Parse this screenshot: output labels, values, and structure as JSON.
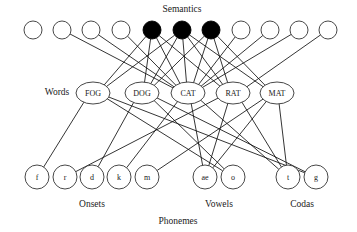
{
  "diagram": {
    "title_label": "Semantics",
    "words_label": "Words",
    "phonemes_label": "Phonemes",
    "onsets_label": "Onsets",
    "vowels_label": "Vowels",
    "codas_label": "Codas",
    "colors": {
      "active_node": "#000000",
      "inactive_node": "#ffffff",
      "node_stroke": "#333333",
      "edge": "#111111",
      "background": "#ffffff",
      "text": "#1a1a1a"
    }
  },
  "semantics": {
    "label": "Semantics",
    "label_x": 182,
    "label_y": 10,
    "y": 30,
    "radius": 9,
    "nodes": [
      {
        "id": "sem1",
        "x": 33,
        "active": false
      },
      {
        "id": "sem2",
        "x": 62,
        "active": false
      },
      {
        "id": "sem3",
        "x": 91,
        "active": false
      },
      {
        "id": "sem4",
        "x": 121,
        "active": false
      },
      {
        "id": "sem5",
        "x": 152,
        "active": true
      },
      {
        "id": "sem6",
        "x": 182,
        "active": true
      },
      {
        "id": "sem7",
        "x": 211,
        "active": true
      },
      {
        "id": "sem8",
        "x": 241,
        "active": false
      },
      {
        "id": "sem9",
        "x": 270,
        "active": false
      },
      {
        "id": "sem10",
        "x": 299,
        "active": false
      },
      {
        "id": "sem11",
        "x": 328,
        "active": false
      }
    ]
  },
  "words": {
    "label": "Words",
    "label_x": 57,
    "label_y": 93,
    "y": 93,
    "rx": 17,
    "ry": 11,
    "nodes": [
      {
        "id": "FOG",
        "label": "FOG",
        "x": 93,
        "onset": "f",
        "vowel": "o",
        "coda": "g"
      },
      {
        "id": "DOG",
        "label": "DOG",
        "x": 142,
        "onset": "d",
        "vowel": "o",
        "coda": "g"
      },
      {
        "id": "CAT",
        "label": "CAT",
        "x": 188,
        "onset": "k",
        "vowel": "ae",
        "coda": "t"
      },
      {
        "id": "RAT",
        "label": "RAT",
        "x": 233,
        "onset": "r",
        "vowel": "ae",
        "coda": "t"
      },
      {
        "id": "MAT",
        "label": "MAT",
        "x": 277,
        "onset": "m",
        "vowel": "ae",
        "coda": "t"
      }
    ]
  },
  "phonemes": {
    "label": "Phonemes",
    "label_x": 178,
    "label_y": 222,
    "y": 177,
    "radius": 12,
    "groups": [
      {
        "name": "Onsets",
        "label": "Onsets",
        "label_x": 92,
        "label_y": 205,
        "nodes": [
          {
            "id": "f",
            "label": "f",
            "x": 37
          },
          {
            "id": "r",
            "label": "r",
            "x": 65
          },
          {
            "id": "d",
            "label": "d",
            "x": 92
          },
          {
            "id": "k",
            "label": "k",
            "x": 119
          },
          {
            "id": "m",
            "label": "m",
            "x": 147
          }
        ]
      },
      {
        "name": "Vowels",
        "label": "Vowels",
        "label_x": 219,
        "label_y": 205,
        "nodes": [
          {
            "id": "ae",
            "label": "ae",
            "x": 205
          },
          {
            "id": "o",
            "label": "o",
            "x": 233
          }
        ]
      },
      {
        "name": "Codas",
        "label": "Codas",
        "label_x": 302,
        "label_y": 205,
        "nodes": [
          {
            "id": "t",
            "label": "t",
            "x": 288
          },
          {
            "id": "g",
            "label": "g",
            "x": 316
          }
        ]
      }
    ]
  },
  "edges": {
    "semantics_to_words": [
      {
        "from": "sem2",
        "to": "CAT"
      },
      {
        "from": "sem3",
        "to": "CAT"
      },
      {
        "from": "sem4",
        "to": "CAT"
      },
      {
        "from": "sem5",
        "to": "FOG"
      },
      {
        "from": "sem5",
        "to": "DOG"
      },
      {
        "from": "sem5",
        "to": "CAT"
      },
      {
        "from": "sem5",
        "to": "RAT"
      },
      {
        "from": "sem6",
        "to": "FOG"
      },
      {
        "from": "sem6",
        "to": "DOG"
      },
      {
        "from": "sem6",
        "to": "CAT"
      },
      {
        "from": "sem6",
        "to": "RAT"
      },
      {
        "from": "sem6",
        "to": "MAT"
      },
      {
        "from": "sem7",
        "to": "DOG"
      },
      {
        "from": "sem7",
        "to": "CAT"
      },
      {
        "from": "sem7",
        "to": "RAT"
      },
      {
        "from": "sem7",
        "to": "MAT"
      },
      {
        "from": "sem8",
        "to": "CAT"
      },
      {
        "from": "sem9",
        "to": "CAT"
      },
      {
        "from": "sem10",
        "to": "CAT"
      },
      {
        "from": "sem11",
        "to": "RAT"
      }
    ],
    "words_to_phonemes": [
      {
        "from": "FOG",
        "to": "f"
      },
      {
        "from": "FOG",
        "to": "o"
      },
      {
        "from": "FOG",
        "to": "g"
      },
      {
        "from": "DOG",
        "to": "d"
      },
      {
        "from": "DOG",
        "to": "o"
      },
      {
        "from": "DOG",
        "to": "g"
      },
      {
        "from": "CAT",
        "to": "k"
      },
      {
        "from": "CAT",
        "to": "ae"
      },
      {
        "from": "CAT",
        "to": "t"
      },
      {
        "from": "RAT",
        "to": "r"
      },
      {
        "from": "RAT",
        "to": "ae"
      },
      {
        "from": "RAT",
        "to": "t"
      },
      {
        "from": "MAT",
        "to": "m"
      },
      {
        "from": "MAT",
        "to": "ae"
      },
      {
        "from": "MAT",
        "to": "t"
      }
    ]
  }
}
